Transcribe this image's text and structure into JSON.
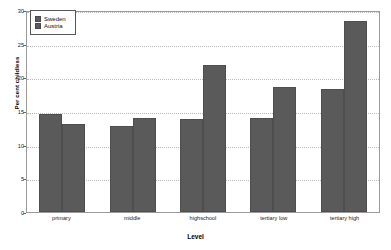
{
  "chart_data": {
    "type": "bar",
    "title": "",
    "xlabel": "Level",
    "ylabel": "Per cent childless",
    "categories": [
      "primary",
      "middle",
      "highschool",
      "tertiary low",
      "tertiary high"
    ],
    "series": [
      {
        "name": "Sweden",
        "values": [
          14.6,
          12.8,
          13.8,
          14.0,
          18.3
        ],
        "color": "#5a5a5a"
      },
      {
        "name": "Austria",
        "values": [
          13.0,
          14.0,
          21.8,
          18.5,
          28.3
        ],
        "color": "#5a5a5a"
      }
    ],
    "ylim": [
      0,
      30
    ],
    "yticks": [
      0,
      5,
      10,
      15,
      20,
      25,
      30
    ],
    "ytick_labels": [
      "0",
      "5",
      "10",
      "15",
      "20",
      "25",
      "30"
    ],
    "grid": true,
    "grid_style": "dotted-horizontal",
    "legend_position": "top-left-inside",
    "legend_entries": [
      "Sweden",
      "Austria"
    ]
  }
}
